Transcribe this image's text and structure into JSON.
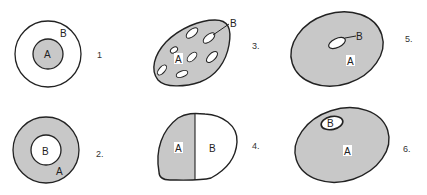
{
  "colors": {
    "shade": "#c8c8c8",
    "stroke": "#222222",
    "background": "#ffffff"
  },
  "panels": [
    {
      "number": "1",
      "labels": {
        "a": "A",
        "b": "B"
      },
      "description": "A shaded circle inside circle B"
    },
    {
      "number": "2.",
      "labels": {
        "a": "A",
        "b": "B"
      },
      "description": "B white circle inside shaded ring A"
    },
    {
      "number": "3.",
      "labels": {
        "a": "A",
        "b": "B"
      },
      "description": "Shaded blob A with multiple white ellipses B"
    },
    {
      "number": "4.",
      "labels": {
        "a": "A",
        "b": "B"
      },
      "description": "Blob split vertically: shaded A left, white B right"
    },
    {
      "number": "5.",
      "labels": {
        "a": "A",
        "b": "B"
      },
      "description": "Shaded ellipse A with small white ellipse B near center"
    },
    {
      "number": "6.",
      "labels": {
        "a": "A",
        "b": "B"
      },
      "description": "Shaded ellipse A with white ellipse B near top edge"
    }
  ]
}
